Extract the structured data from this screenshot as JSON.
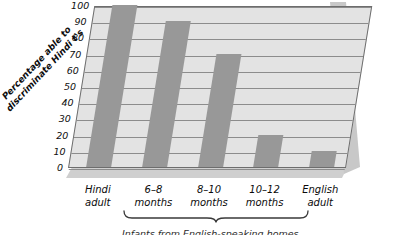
{
  "chart_data": {
    "type": "bar",
    "title": "",
    "xlabel": "",
    "ylabel": "Percentage able to discriminate Hindi t's",
    "ylabel_line1": "Percentage able to",
    "ylabel_line2": "discriminate Hindi t's",
    "ylim": [
      0,
      100
    ],
    "ytick_values": [
      0,
      10,
      20,
      30,
      40,
      50,
      60,
      70,
      80,
      90,
      100
    ],
    "ytick_labels": [
      "0",
      "10",
      "20",
      "30",
      "40",
      "50",
      "60",
      "70",
      "80",
      "90",
      "100"
    ],
    "grid": true,
    "legend": "none",
    "categories": [
      "Hindi adult",
      "6–8 months",
      "8–10 months",
      "10–12 months",
      "English adult"
    ],
    "category_lines": [
      [
        "Hindi",
        "adult"
      ],
      [
        "6–8",
        "months"
      ],
      [
        "8–10",
        "months"
      ],
      [
        "10–12",
        "months"
      ],
      [
        "English",
        "adult"
      ]
    ],
    "values": [
      100,
      90,
      70,
      20,
      10
    ],
    "annotation_brace_label": "Infants from English-speaking homes",
    "annotation_brace_spans": [
      "6–8 months",
      "8–10 months",
      "10–12 months"
    ],
    "colors": {
      "bar": "#989898",
      "plot_background": "#e3e3e3",
      "gridline": "#8c8c8c",
      "axis_line": "#6d6d6d",
      "floor_slab": "#cfcfcf",
      "side_slab": "#c8c8c8",
      "text": "#0b0b0b",
      "page_background": "#ffffff"
    }
  }
}
